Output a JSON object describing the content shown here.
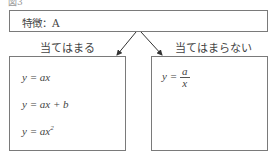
{
  "header_cut_text": "図3",
  "top_box": {
    "label": "特徴：A"
  },
  "branches": {
    "yes_label": "当てはまる",
    "no_label": "当てはまらない"
  },
  "left_box": {
    "equations": [
      "y = ax",
      "y = ax + b",
      "y = ax²"
    ],
    "eq1_lhs": "y = ax",
    "eq2_lhs": "y = ax + b",
    "eq3_base": "y = ax",
    "eq3_exp": "2"
  },
  "right_box": {
    "equation": "y = a/x",
    "eq_lhs": "y =",
    "eq_num": "a",
    "eq_den": "x"
  },
  "colors": {
    "border": "#7a7a7a",
    "text": "#444444",
    "arrow": "#333333"
  }
}
